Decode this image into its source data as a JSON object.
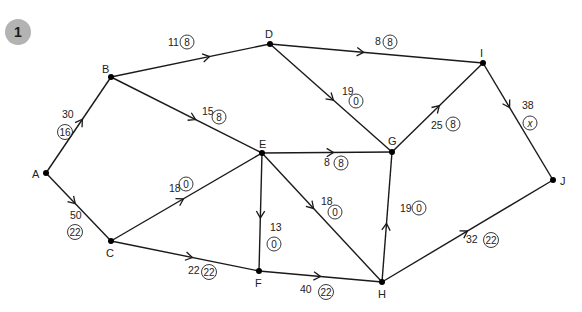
{
  "badge": {
    "label": "1",
    "color": "#b3b3b3"
  },
  "colors": {
    "edge": "#1a1a1a",
    "node": "#000000",
    "text": "#222222"
  },
  "nodes": [
    {
      "id": "A",
      "x": 46,
      "y": 173,
      "lx": 32,
      "ly": 178
    },
    {
      "id": "B",
      "x": 111,
      "y": 77,
      "lx": 102,
      "ly": 73
    },
    {
      "id": "C",
      "x": 111,
      "y": 241,
      "lx": 106,
      "ly": 257
    },
    {
      "id": "D",
      "x": 270,
      "y": 44,
      "lx": 265,
      "ly": 38
    },
    {
      "id": "E",
      "x": 262,
      "y": 153,
      "lx": 259,
      "ly": 148
    },
    {
      "id": "F",
      "x": 259,
      "y": 271,
      "lx": 255,
      "ly": 287
    },
    {
      "id": "G",
      "x": 392,
      "y": 152,
      "lx": 388,
      "ly": 145
    },
    {
      "id": "H",
      "x": 382,
      "y": 282,
      "lx": 378,
      "ly": 298
    },
    {
      "id": "I",
      "x": 483,
      "y": 63,
      "lx": 480,
      "ly": 57
    },
    {
      "id": "J",
      "x": 553,
      "y": 180,
      "lx": 560,
      "ly": 185
    }
  ],
  "edges": [
    {
      "from": "A",
      "to": "B",
      "capacity": "30",
      "flow": "16",
      "cx": 62,
      "cy": 118,
      "fx": 65,
      "fy": 132,
      "t": 0.56
    },
    {
      "from": "A",
      "to": "C",
      "capacity": "50",
      "flow": "22",
      "cx": 70,
      "cy": 219,
      "fx": 75,
      "fy": 232,
      "t": 0.45
    },
    {
      "from": "B",
      "to": "D",
      "capacity": "11",
      "flow": "8",
      "cx": 168,
      "cy": 46,
      "fx": 187,
      "fy": 42,
      "t": 0.62
    },
    {
      "from": "B",
      "to": "E",
      "capacity": "15",
      "flow": "8",
      "cx": 202,
      "cy": 115,
      "fx": 219,
      "fy": 117,
      "t": 0.56
    },
    {
      "from": "D",
      "to": "I",
      "capacity": "8",
      "flow": "8",
      "cx": 375,
      "cy": 45,
      "fx": 390,
      "fy": 42,
      "t": 0.44
    },
    {
      "from": "D",
      "to": "G",
      "capacity": "19",
      "flow": "0",
      "cx": 342,
      "cy": 95,
      "fx": 356,
      "fy": 101,
      "t": 0.52
    },
    {
      "from": "C",
      "to": "E",
      "capacity": "18",
      "flow": "0",
      "cx": 169,
      "cy": 192,
      "fx": 186,
      "fy": 184,
      "t": 0.48
    },
    {
      "from": "C",
      "to": "F",
      "capacity": "22",
      "flow": "22",
      "cx": 188,
      "cy": 274,
      "fx": 209,
      "fy": 272,
      "t": 0.55
    },
    {
      "from": "E",
      "to": "G",
      "capacity": "8",
      "flow": "8",
      "cx": 324,
      "cy": 166,
      "fx": 341,
      "fy": 163,
      "t": 0.55
    },
    {
      "from": "E",
      "to": "F",
      "capacity": "13",
      "flow": "0",
      "cx": 270,
      "cy": 231,
      "fx": 274,
      "fy": 244,
      "t": 0.55
    },
    {
      "from": "E",
      "to": "H",
      "capacity": "18",
      "flow": "0",
      "cx": 321,
      "cy": 205,
      "fx": 335,
      "fy": 212,
      "t": 0.43
    },
    {
      "from": "F",
      "to": "H",
      "capacity": "40",
      "flow": "22",
      "cx": 300,
      "cy": 293,
      "fx": 326,
      "fy": 292,
      "t": 0.5
    },
    {
      "from": "H",
      "to": "G",
      "capacity": "19",
      "flow": "0",
      "cx": 400,
      "cy": 212,
      "fx": 419,
      "fy": 208,
      "t": 0.45
    },
    {
      "from": "G",
      "to": "I",
      "capacity": "25",
      "flow": "8",
      "cx": 431,
      "cy": 129,
      "fx": 453,
      "fy": 124,
      "t": 0.52
    },
    {
      "from": "I",
      "to": "J",
      "capacity": "38",
      "flow": "x",
      "cx": 522,
      "cy": 109,
      "fx": 530,
      "fy": 123,
      "t": 0.38,
      "italic": true
    },
    {
      "from": "H",
      "to": "J",
      "capacity": "32",
      "flow": "22",
      "cx": 466,
      "cy": 243,
      "fx": 491,
      "fy": 240,
      "t": 0.5
    }
  ]
}
